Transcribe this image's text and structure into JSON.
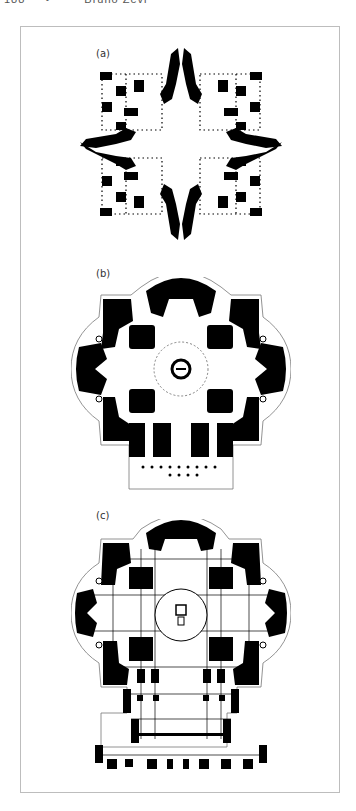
{
  "page": {
    "running_head": {
      "page_number": "188",
      "separator": "•",
      "title": "Bruno Zevi"
    }
  },
  "figure": {
    "panels": [
      {
        "label": "(a)",
        "description": "Centralized Greek-cross floor plan with four corner chapels"
      },
      {
        "label": "(b)",
        "description": "Greek-cross plan with central dome, apses and front portico colonnade"
      },
      {
        "label": "(c)",
        "description": "Extended Latin-cross plan with nave, central dome and facade"
      }
    ],
    "colors": {
      "ink": "#000000",
      "frame": "#bdbdbd",
      "paper": "#ffffff"
    }
  }
}
